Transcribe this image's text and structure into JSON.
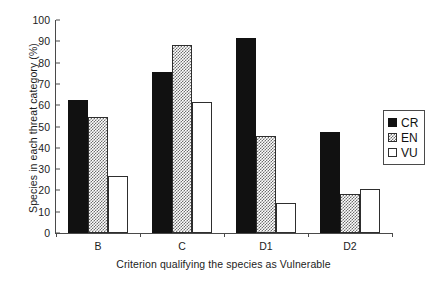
{
  "chart_data": {
    "type": "bar",
    "title": "",
    "xlabel": "Criterion qualifying the species as Vulnerable",
    "ylabel": "Species in each threat category (%)",
    "categories": [
      "B",
      "C",
      "D1",
      "D2"
    ],
    "series": [
      {
        "name": "CR",
        "color": "#111111",
        "values": [
          62.5,
          75.5,
          91.5,
          47.5
        ]
      },
      {
        "name": "EN",
        "color": "#808080",
        "values": [
          54.5,
          88.5,
          45.5,
          18.5
        ]
      },
      {
        "name": "VU",
        "color": "#ffffff",
        "values": [
          27.0,
          61.5,
          14.0,
          20.5
        ]
      }
    ],
    "ylim": [
      0,
      100
    ],
    "yticks": [
      0,
      10,
      20,
      30,
      40,
      50,
      60,
      70,
      80,
      90,
      100
    ],
    "ytick_labels": [
      "0",
      "10",
      "20",
      "30",
      "40",
      "50",
      "60",
      "70",
      "80",
      "90",
      "100"
    ],
    "grid": false,
    "legend_position": "right"
  },
  "legend": {
    "entries": [
      {
        "label": "CR"
      },
      {
        "label": "EN"
      },
      {
        "label": "VU"
      }
    ]
  }
}
